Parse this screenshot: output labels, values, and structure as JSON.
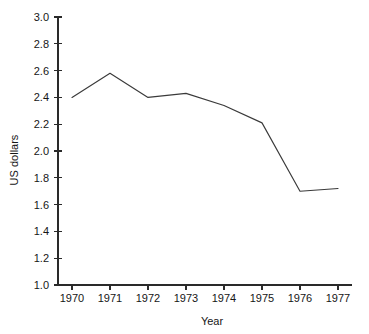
{
  "chart_data": {
    "type": "line",
    "title": "",
    "subtitle": "",
    "xlabel": "Year",
    "ylabel": "US dollars",
    "x": [
      1970,
      1971,
      1972,
      1973,
      1974,
      1975,
      1976,
      1977
    ],
    "categories": [
      "1970",
      "1971",
      "1972",
      "1973",
      "1974",
      "1975",
      "1976",
      "1977"
    ],
    "values": [
      2.4,
      2.58,
      2.4,
      2.43,
      2.34,
      2.21,
      1.7,
      1.72
    ],
    "series": [
      {
        "name": "US dollars",
        "values": [
          2.4,
          2.58,
          2.4,
          2.43,
          2.34,
          2.21,
          1.7,
          1.72
        ]
      }
    ],
    "xlim": [
      1970,
      1977
    ],
    "ylim": [
      1.0,
      3.0
    ],
    "ytick_values": [
      1.0,
      1.2,
      1.4,
      1.6,
      1.8,
      2.0,
      2.2,
      2.4,
      2.6,
      2.8,
      3.0
    ],
    "ytick_labels": [
      "1.0",
      "1.2",
      "1.4",
      "1.6",
      "1.8",
      "2.0",
      "2.2",
      "2.4",
      "2.6",
      "2.8",
      "3.0"
    ],
    "xtick_labels": [
      "1970",
      "1971",
      "1972",
      "1973",
      "1974",
      "1975",
      "1976",
      "1977"
    ],
    "grid": false,
    "legend": false,
    "legend_position": "none",
    "line_color": "#3a3a3a",
    "axis_color": "#2a2a2a",
    "background_color": "#ffffff",
    "annotations": []
  }
}
